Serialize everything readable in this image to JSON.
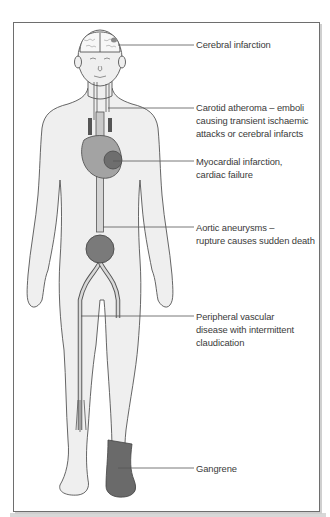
{
  "figure": {
    "colors": {
      "skin": "#efefef",
      "outline": "#555555",
      "vessel": "#d4d4d4",
      "organ": "#8f8f8f",
      "lesion": "#5f5f5f",
      "gangrene": "#6a6a6a",
      "leader_line": "#555555",
      "frame_border": "#6e6e6e"
    },
    "annotations": [
      {
        "id": "cerebral",
        "lines": [
          "Cerebral infarction"
        ]
      },
      {
        "id": "carotid",
        "lines": [
          "Carotid atheroma – emboli",
          "causing transient ischaemic",
          "attacks or cerebral infarcts"
        ]
      },
      {
        "id": "myocardial",
        "lines": [
          "Myocardial infarction,",
          "cardiac failure"
        ]
      },
      {
        "id": "aortic",
        "lines": [
          "Aortic aneurysms –",
          "rupture causes sudden death"
        ]
      },
      {
        "id": "peripheral",
        "lines": [
          "Peripheral vascular",
          "disease with intermittent",
          "claudication"
        ]
      },
      {
        "id": "gangrene",
        "lines": [
          "Gangrene"
        ]
      }
    ]
  }
}
